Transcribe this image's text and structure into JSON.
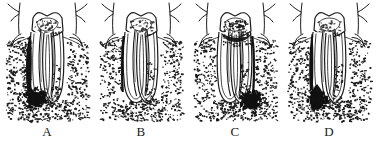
{
  "figure": {
    "background_color": "#ffffff",
    "ink_color": "#1a1a1a",
    "lesion_color": "#111111",
    "panel_count": 4
  },
  "panels": [
    {
      "label": "A",
      "name": "panel-a",
      "lesion_type": "primary-periodontal-lesion",
      "lesion_description": "Wide dark periodontal pocket tracking down mesial root surface to broad apical radiolucency",
      "pocket_side": "mesial",
      "pocket_width": "wide",
      "apical_lesion": true,
      "apical_lesion_side": "mesial",
      "crown_shade": "light-stipple"
    },
    {
      "label": "B",
      "name": "panel-b",
      "lesion_type": "narrow-periodontal-defect",
      "lesion_description": "Thin dark vertical defect along mesial root surface without apical radiolucency",
      "pocket_side": "mesial",
      "pocket_width": "narrow",
      "apical_lesion": false,
      "apical_lesion_side": "none",
      "crown_shade": "light-stipple"
    },
    {
      "label": "C",
      "name": "panel-c",
      "lesion_type": "primary-endodontic-lesion",
      "lesion_description": "Dark periapical radiolucency at distal root apex with dark furcation involvement",
      "pocket_side": "distal",
      "pocket_width": "narrow",
      "apical_lesion": true,
      "apical_lesion_side": "distal",
      "crown_shade": "dark-stipple"
    },
    {
      "label": "D",
      "name": "panel-d",
      "lesion_type": "combined-endodontic-periodontal-lesion",
      "lesion_description": "Dark pocket along mesial root joining a teardrop-shaped apical radiolucency",
      "pocket_side": "mesial",
      "pocket_width": "medium",
      "apical_lesion": true,
      "apical_lesion_side": "mesial",
      "crown_shade": "light-stipple"
    }
  ]
}
